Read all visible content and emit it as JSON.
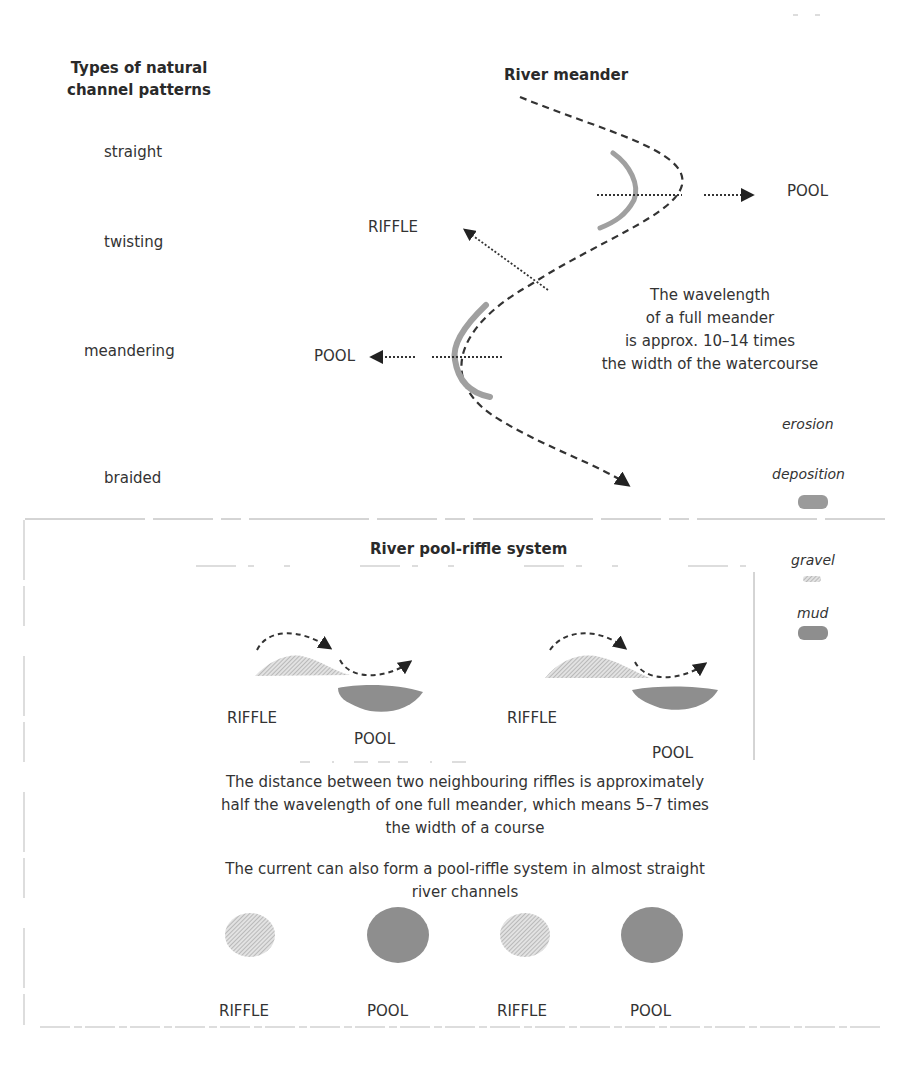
{
  "patterns": {
    "title_line1": "Types of natural",
    "title_line2": "channel patterns",
    "items": [
      {
        "label": "straight"
      },
      {
        "label": "twisting"
      },
      {
        "label": "meandering"
      },
      {
        "label": "braided"
      }
    ]
  },
  "meander": {
    "title": "River meander",
    "pool_right": "POOL",
    "riffle_label": "RIFFLE",
    "pool_left": "POOL",
    "wavelength_lines": [
      "The wavelength",
      "of a full meander",
      "is approx. 10–14 times",
      "the width of the watercourse"
    ]
  },
  "legend": {
    "erosion": "erosion",
    "deposition": "deposition",
    "gravel": "gravel",
    "mud": "mud",
    "colors": {
      "erosion_deposition": "#9a9a9a",
      "gravel": "#c4c4c4",
      "mud": "#8e8e8e"
    }
  },
  "pool_riffle": {
    "title": "River pool-riffle system",
    "sequence": [
      {
        "label": "RIFFLE"
      },
      {
        "label": "POOL"
      },
      {
        "label": "RIFFLE"
      },
      {
        "label": "POOL"
      }
    ],
    "caption1_lines": [
      "The distance between two neighbouring riffles is approximately",
      "half the wavelength of one full meander, which means 5–7 times",
      "the width of a course"
    ],
    "caption2_lines": [
      "The current can also form a pool-riffle system in almost straight",
      "river channels"
    ],
    "straight_sequence": [
      {
        "label": "RIFFLE"
      },
      {
        "label": "POOL"
      },
      {
        "label": "RIFFLE"
      },
      {
        "label": "POOL"
      }
    ]
  }
}
